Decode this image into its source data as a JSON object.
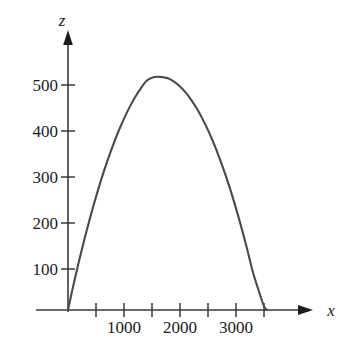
{
  "chart_data": {
    "type": "line",
    "title": "",
    "subtitle": "",
    "xlabel": "x",
    "ylabel": "z",
    "grid": false,
    "legend": false,
    "legend_position": "none",
    "xlim": [
      0,
      3800
    ],
    "ylim": [
      0,
      560
    ],
    "x_ticks": [
      0,
      500,
      1000,
      1500,
      2000,
      2500,
      3000,
      3500,
      4000
    ],
    "x_tick_labels": [
      "",
      "",
      "1000",
      "",
      "2000",
      "",
      "3000",
      "",
      ""
    ],
    "y_ticks": [
      100,
      200,
      300,
      400,
      500
    ],
    "y_tick_labels": [
      "100",
      "200",
      "300",
      "400",
      "500"
    ],
    "curve_color": "#4a4a4a",
    "axis_color": "#3a3a3a",
    "series": [
      {
        "name": "z(x)",
        "x": [
          0,
          100,
          200,
          300,
          400,
          500,
          600,
          700,
          800,
          900,
          1000,
          1100,
          1200,
          1300,
          1400,
          1500,
          1600,
          1700,
          1740,
          1800,
          1900,
          2000,
          2100,
          2200,
          2300,
          2400,
          2500,
          2600,
          2700,
          2800,
          2900,
          3000,
          3100,
          3200,
          3300,
          3400,
          3500,
          3560
        ],
        "y": [
          0,
          56,
          108,
          157,
          203,
          246,
          286,
          323,
          357,
          388,
          416,
          441,
          463,
          482,
          498,
          505,
          507,
          506,
          505,
          503,
          496,
          486,
          473,
          457,
          438,
          416,
          391,
          363,
          332,
          298,
          261,
          221,
          178,
          132,
          83,
          44,
          8,
          0
        ]
      }
    ],
    "peak": {
      "x": 1740,
      "z": 505
    },
    "x_intercepts": [
      0,
      3560
    ]
  },
  "axes": {
    "x_axis_label": "x",
    "y_axis_label": "z"
  }
}
